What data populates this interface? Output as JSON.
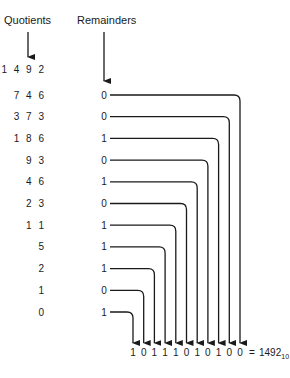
{
  "headers": {
    "quotients": "Quotients",
    "remainders": "Remainders"
  },
  "start_value": "1 4 9 2",
  "rows": [
    {
      "quotient": "7 4 6",
      "remainder": "0"
    },
    {
      "quotient": "3 7 3",
      "remainder": "0"
    },
    {
      "quotient": "1 8 6",
      "remainder": "1"
    },
    {
      "quotient": "9 3",
      "remainder": "0"
    },
    {
      "quotient": "4 6",
      "remainder": "1"
    },
    {
      "quotient": "2 3",
      "remainder": "0"
    },
    {
      "quotient": "1 1",
      "remainder": "1"
    },
    {
      "quotient": "5",
      "remainder": "1"
    },
    {
      "quotient": "2",
      "remainder": "1"
    },
    {
      "quotient": "1",
      "remainder": "0"
    },
    {
      "quotient": "0",
      "remainder": "1"
    }
  ],
  "result": {
    "bits": [
      "1",
      "0",
      "1",
      "1",
      "1",
      "0",
      "1",
      "0",
      "1",
      "0",
      "0"
    ],
    "equals": "=",
    "decimal_value": "1492",
    "base_subscript": "10"
  },
  "colors": {
    "ink": "#1a1a1a",
    "background": "#ffffff"
  }
}
